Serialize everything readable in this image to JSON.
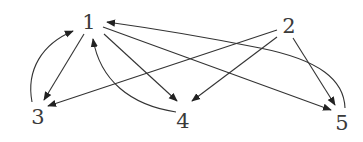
{
  "diagram": {
    "type": "directed-graph",
    "colors": {
      "edge": "#333333",
      "label": "#3a3a3a",
      "background": "#ffffff"
    },
    "nodes": [
      {
        "id": "1",
        "label": "1",
        "x": 89,
        "y": 22
      },
      {
        "id": "2",
        "label": "2",
        "x": 289,
        "y": 26
      },
      {
        "id": "3",
        "label": "3",
        "x": 38,
        "y": 117
      },
      {
        "id": "4",
        "label": "4",
        "x": 183,
        "y": 121
      },
      {
        "id": "5",
        "label": "5",
        "x": 342,
        "y": 123
      }
    ],
    "edges": [
      {
        "from": "1",
        "to": "3",
        "style": "straight"
      },
      {
        "from": "3",
        "to": "1",
        "style": "curved"
      },
      {
        "from": "1",
        "to": "4",
        "style": "straight"
      },
      {
        "from": "4",
        "to": "1",
        "style": "curved"
      },
      {
        "from": "1",
        "to": "5",
        "style": "straight"
      },
      {
        "from": "5",
        "to": "1",
        "style": "curved"
      },
      {
        "from": "2",
        "to": "3",
        "style": "straight"
      },
      {
        "from": "2",
        "to": "4",
        "style": "straight"
      },
      {
        "from": "2",
        "to": "5",
        "style": "straight"
      }
    ]
  }
}
